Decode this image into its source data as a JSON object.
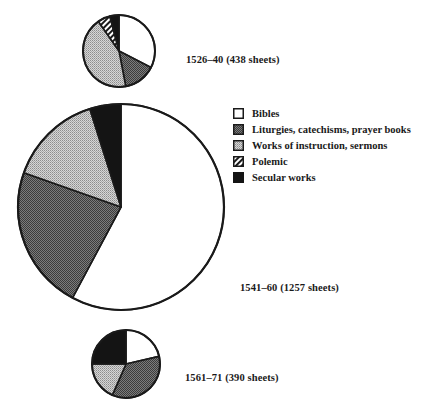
{
  "chart_data": {
    "type": "pie",
    "title": "",
    "categories": [
      "Bibles",
      "Liturgies, catechisms, prayer books",
      "Works of instruction, sermons",
      "Polemic",
      "Secular works"
    ],
    "series": [
      {
        "name": "1526–40 (438 sheets)",
        "period": "1526–40",
        "sheets": 438,
        "values_pct": [
          32.6,
          14.4,
          43.3,
          5.6,
          4.1
        ],
        "center": [
          119,
          51
        ],
        "radius": 36
      },
      {
        "name": "1541–60 (1257 sheets)",
        "period": "1541–60",
        "sheets": 1257,
        "values_pct": [
          57.8,
          22.6,
          14.7,
          0,
          4.9
        ],
        "center": [
          121,
          207
        ],
        "radius": 103
      },
      {
        "name": "1561–71 (390 sheets)",
        "period": "1561–71",
        "sheets": 390,
        "values_pct": [
          21.4,
          35.2,
          18.4,
          0,
          25.0
        ],
        "center": [
          126,
          364
        ],
        "radius": 34
      }
    ],
    "start_angle_deg": 0,
    "direction": "clockwise",
    "legend_position": "right",
    "grid": false
  },
  "labels": {
    "pie1": "1526–40 (438 sheets)",
    "pie2": "1541–60 (1257 sheets)",
    "pie3": "1561–71 (390 sheets)"
  },
  "legend": {
    "items": [
      {
        "label": "Bibles",
        "pattern": "white"
      },
      {
        "label": "Liturgies, catechisms, prayer books",
        "pattern": "dark-stipple"
      },
      {
        "label": "Works of instruction, sermons",
        "pattern": "light-stipple"
      },
      {
        "label": "Polemic",
        "pattern": "diagonal-hatch"
      },
      {
        "label": "Secular works",
        "pattern": "black"
      }
    ]
  },
  "styles": {
    "stroke": "#1a1a1a",
    "black_fill": "#141414",
    "dark_stipple_bg": "#7a7a7a",
    "dark_stipple_fg": "#3a3a3a",
    "light_stipple_bg": "#c8c8c8",
    "light_stipple_fg": "#8a8a8a"
  }
}
